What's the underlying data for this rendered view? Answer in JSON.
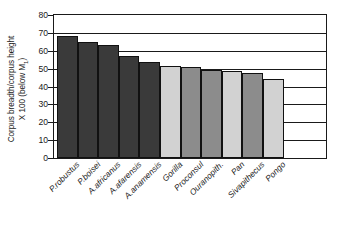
{
  "chart_data": {
    "type": "bar",
    "title": "",
    "xlabel": "",
    "ylabel_line1": "Corpus breadth/corpus height",
    "ylabel_line2_pre": "X 100 (below M",
    "ylabel_line2_sub": "1",
    "ylabel_line2_post": ")",
    "categories": [
      "P.robustus",
      "P.boisei",
      "A.africanus",
      "A.afarensis",
      "A.anamensis",
      "Gorilla",
      "Proconsul",
      "Ouranopith.",
      "Pan",
      "Sivapithecus",
      "Pongo"
    ],
    "values": [
      68.5,
      65.0,
      63.5,
      57.0,
      53.5,
      51.5,
      51.0,
      49.5,
      48.5,
      47.5,
      44.0
    ],
    "bar_colors": [
      "#3a3a3a",
      "#3a3a3a",
      "#3a3a3a",
      "#3a3a3a",
      "#3a3a3a",
      "#d2d2d2",
      "#8c8c8c",
      "#8c8c8c",
      "#d2d2d2",
      "#8c8c8c",
      "#d2d2d2"
    ],
    "ylim": [
      0,
      80
    ],
    "yticks": [
      0,
      10,
      20,
      30,
      40,
      50,
      60,
      70,
      80
    ],
    "ytick_labels": [
      "0",
      "10",
      "20",
      "30",
      "40",
      "50",
      "60",
      "70",
      "80"
    ],
    "grid": true,
    "grid_axis": "y",
    "legend": "none"
  }
}
